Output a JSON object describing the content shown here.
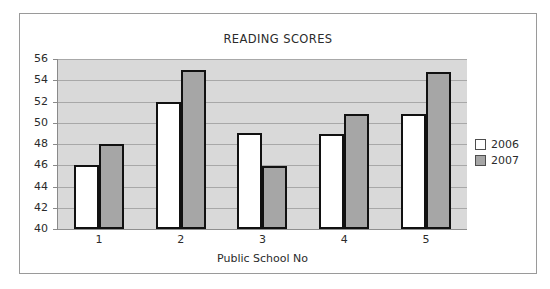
{
  "chart_data": {
    "type": "bar",
    "title": "READING SCORES",
    "xlabel": "Public School No",
    "ylabel": "",
    "categories": [
      "1",
      "2",
      "3",
      "4",
      "5"
    ],
    "series": [
      {
        "name": "2006",
        "color": "#ffffff",
        "values": [
          46,
          52,
          49,
          48.9,
          50.8
        ]
      },
      {
        "name": "2007",
        "color": "#a6a6a6",
        "values": [
          48,
          55,
          45.9,
          50.8,
          54.8
        ]
      }
    ],
    "ylim": [
      40,
      56
    ],
    "ytick_step": 2,
    "yticks": [
      "56",
      "54",
      "52",
      "50",
      "48",
      "46",
      "44",
      "42",
      "40"
    ],
    "grid": true,
    "legend_position": "right",
    "plot_background": "#d9d9d9",
    "bar_border_color": "#111111"
  },
  "legend": {
    "entries": [
      {
        "label": "2006"
      },
      {
        "label": "2007"
      }
    ]
  }
}
